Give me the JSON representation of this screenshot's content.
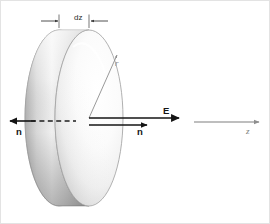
{
  "figure": {
    "width": 270,
    "height": 224,
    "background_color": "#ffffff",
    "border_color": "#e3e3e3"
  },
  "labels": {
    "thickness": "dz",
    "radius": "r",
    "field": "E",
    "normal_right": "n",
    "normal_left": "n",
    "axis": "z"
  },
  "colors": {
    "ink": "#141414",
    "dimension_line": "#3c3c3c",
    "radius_line": "#8d8d8d",
    "axis_line": "#a8a8a8",
    "disk_face_light": "#ffffff",
    "disk_face_mid": "#efefef",
    "disk_face_shadow": "#c9c9c9",
    "disk_rim_light": "#f2f2f2",
    "disk_rim_mid": "#cfcfcf",
    "disk_rim_dark": "#9a9a9a",
    "disk_outline": "#9d9d9d"
  },
  "geometry": {
    "disk_center_x": 88,
    "disk_center_y": 117,
    "disk_face_rx": 34,
    "disk_face_ry": 88,
    "disk_thickness_px": 30,
    "dimension_y": 20,
    "dimension_left_x": 58,
    "dimension_right_x": 102,
    "axis_y": 121
  },
  "vectors": {
    "E": {
      "label": "E",
      "from_x": 88,
      "from_y": 117,
      "to_x": 178,
      "to_y": 117,
      "direction": "right",
      "weight": "bold"
    },
    "normal_right": {
      "label": "n",
      "from_x": 88,
      "from_y": 124,
      "to_x": 146,
      "to_y": 124,
      "direction": "right",
      "weight": "bold"
    },
    "normal_left": {
      "label": "n",
      "from_x": 33,
      "from_y": 120,
      "to_x": 10,
      "to_y": 120,
      "direction": "left",
      "weight": "bold",
      "dashed_continuation": true
    },
    "z_axis": {
      "label": "z",
      "from_x": 193,
      "from_y": 121,
      "to_x": 258,
      "to_y": 121,
      "direction": "right",
      "weight": "light"
    },
    "radius": {
      "label": "r",
      "from_x": 88,
      "from_y": 117,
      "to_x": 117,
      "to_y": 52,
      "direction": "up-right",
      "weight": "light"
    }
  }
}
